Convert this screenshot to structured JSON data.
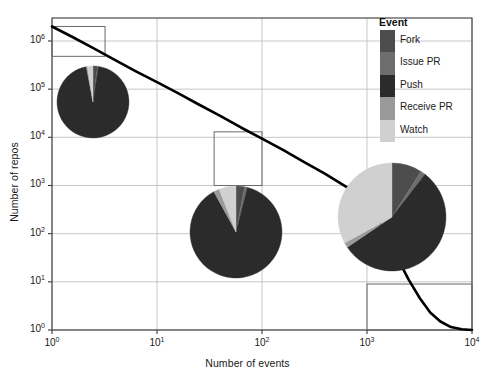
{
  "chart_data": {
    "type": "line",
    "title": "",
    "xlabel": "Number of events",
    "ylabel": "Number of repos",
    "xscale": "log",
    "yscale": "log",
    "xlim": [
      1,
      10000
    ],
    "ylim": [
      1,
      3000000
    ],
    "grid": true,
    "xticks": [
      {
        "value": 1,
        "mantissa": "10",
        "exponent": "0"
      },
      {
        "value": 10,
        "mantissa": "10",
        "exponent": "1"
      },
      {
        "value": 100,
        "mantissa": "10",
        "exponent": "2"
      },
      {
        "value": 1000,
        "mantissa": "10",
        "exponent": "3"
      },
      {
        "value": 10000,
        "mantissa": "10",
        "exponent": "4"
      }
    ],
    "yticks": [
      {
        "value": 1,
        "mantissa": "10",
        "exponent": "0"
      },
      {
        "value": 10,
        "mantissa": "10",
        "exponent": "1"
      },
      {
        "value": 100,
        "mantissa": "10",
        "exponent": "2"
      },
      {
        "value": 1000,
        "mantissa": "10",
        "exponent": "3"
      },
      {
        "value": 10000,
        "mantissa": "10",
        "exponent": "4"
      },
      {
        "value": 100000,
        "mantissa": "10",
        "exponent": "5"
      },
      {
        "value": 1000000,
        "mantissa": "10",
        "exponent": "6"
      }
    ],
    "series": [
      {
        "name": "repo count distribution",
        "color": "#000000",
        "linewidth": 2.6,
        "x": [
          1,
          1.6,
          2.5,
          4,
          6.3,
          10,
          16,
          25,
          40,
          63,
          100,
          160,
          250,
          400,
          630,
          1000,
          1300,
          1600,
          2000,
          2500,
          3200,
          4000,
          5000,
          6300,
          8000,
          10000
        ],
        "y": [
          2000000,
          1180000,
          700000,
          400000,
          235000,
          140000,
          82000,
          48000,
          28000,
          16000,
          9400,
          5400,
          3100,
          1750,
          950,
          500,
          180,
          70,
          28,
          11,
          4.5,
          2.3,
          1.5,
          1.15,
          1.04,
          1.0
        ]
      }
    ],
    "highlight_boxes": [
      {
        "name": "low-activity-region",
        "x0": 1,
        "x1": 3.2,
        "y0": 480000,
        "y1": 2000000
      },
      {
        "name": "mid-activity-region",
        "x0": 35,
        "x1": 100,
        "y0": 1000,
        "y1": 13000
      },
      {
        "name": "high-activity-region",
        "x0": 1000,
        "x1": 10000,
        "y0": 1,
        "y1": 9
      }
    ],
    "pies": [
      {
        "name": "pie-low-activity",
        "cx": 93,
        "cy": 102,
        "r": 36,
        "slices": [
          {
            "label": "Fork",
            "value": 2.0
          },
          {
            "label": "Issue PR",
            "value": 0.4
          },
          {
            "label": "Push",
            "value": 94.6
          },
          {
            "label": "Receive PR",
            "value": 0.5
          },
          {
            "label": "Watch",
            "value": 2.5
          }
        ]
      },
      {
        "name": "pie-mid-activity",
        "cx": 236,
        "cy": 232,
        "r": 46,
        "slices": [
          {
            "label": "Fork",
            "value": 3.0
          },
          {
            "label": "Issue PR",
            "value": 1.0
          },
          {
            "label": "Push",
            "value": 88.0
          },
          {
            "label": "Receive PR",
            "value": 2.0
          },
          {
            "label": "Watch",
            "value": 6.0
          }
        ]
      },
      {
        "name": "pie-high-activity",
        "cx": 392,
        "cy": 217,
        "r": 54,
        "slices": [
          {
            "label": "Fork",
            "value": 9.0
          },
          {
            "label": "Issue PR",
            "value": 1.5
          },
          {
            "label": "Push",
            "value": 55.0
          },
          {
            "label": "Receive PR",
            "value": 1.5
          },
          {
            "label": "Watch",
            "value": 33.0
          }
        ]
      }
    ],
    "legend": {
      "title": "Event",
      "position": "top-right",
      "entries": [
        {
          "label": "Fork",
          "color": "#4d4d4d"
        },
        {
          "label": "Issue PR",
          "color": "#6e6e6e"
        },
        {
          "label": "Push",
          "color": "#2b2b2b"
        },
        {
          "label": "Receive PR",
          "color": "#9a9a9a"
        },
        {
          "label": "Watch",
          "color": "#d0d0d0"
        }
      ]
    },
    "style": {
      "grid_color": "#b9b9b9",
      "frame_color": "#3a3a3a",
      "box_color": "#6a6a6a",
      "background": "#ffffff"
    },
    "plot_area": {
      "left": 52,
      "right": 472,
      "top": 18,
      "bottom": 330
    }
  }
}
